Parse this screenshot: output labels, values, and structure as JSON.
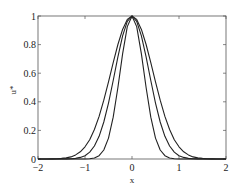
{
  "chart_data": {
    "type": "line",
    "title": "",
    "xlabel": "x",
    "ylabel": "u*",
    "xlim": [
      -2,
      2
    ],
    "ylim": [
      0,
      1
    ],
    "grid": false,
    "legend": null,
    "xticks": [
      "-2",
      "-1",
      "0",
      "1",
      "2"
    ],
    "yticks": [
      "0",
      "0.2",
      "0.4",
      "0.6",
      "0.8",
      "1"
    ],
    "x": [
      -2,
      -1.9,
      -1.8,
      -1.7,
      -1.6,
      -1.5,
      -1.4,
      -1.3,
      -1.2,
      -1.1,
      -1.0,
      -0.9,
      -0.8,
      -0.7,
      -0.6,
      -0.5,
      -0.4,
      -0.3,
      -0.2,
      -0.1,
      0,
      0.1,
      0.2,
      0.3,
      0.4,
      0.5,
      0.6,
      0.7,
      0.8,
      0.9,
      1.0,
      1.1,
      1.2,
      1.3,
      1.4,
      1.5,
      1.6,
      1.7,
      1.8,
      1.9,
      2.0
    ],
    "series": [
      {
        "name": "narrow",
        "color": "#222222",
        "values": [
          0,
          0,
          0,
          0,
          0,
          0,
          0,
          0,
          0,
          0,
          0,
          0.002,
          0.007,
          0.023,
          0.063,
          0.146,
          0.292,
          0.5,
          0.735,
          0.926,
          1,
          0.926,
          0.735,
          0.5,
          0.292,
          0.146,
          0.063,
          0.023,
          0.007,
          0.002,
          0,
          0,
          0,
          0,
          0,
          0,
          0,
          0,
          0,
          0,
          0
        ]
      },
      {
        "name": "medium",
        "color": "#222222",
        "values": [
          0,
          0,
          0,
          0,
          0,
          0,
          0.001,
          0.002,
          0.004,
          0.011,
          0.023,
          0.048,
          0.091,
          0.159,
          0.259,
          0.391,
          0.549,
          0.714,
          0.861,
          0.963,
          1,
          0.963,
          0.861,
          0.714,
          0.549,
          0.391,
          0.259,
          0.159,
          0.091,
          0.048,
          0.023,
          0.011,
          0.004,
          0.002,
          0.001,
          0,
          0,
          0,
          0,
          0,
          0
        ]
      },
      {
        "name": "wide",
        "color": "#222222",
        "values": [
          0,
          0,
          0,
          0.001,
          0.002,
          0.004,
          0.008,
          0.015,
          0.029,
          0.05,
          0.085,
          0.135,
          0.206,
          0.298,
          0.411,
          0.539,
          0.674,
          0.801,
          0.906,
          0.976,
          1,
          0.976,
          0.906,
          0.801,
          0.674,
          0.539,
          0.411,
          0.298,
          0.206,
          0.135,
          0.085,
          0.05,
          0.029,
          0.015,
          0.008,
          0.004,
          0.002,
          0.001,
          0,
          0,
          0
        ]
      }
    ]
  }
}
